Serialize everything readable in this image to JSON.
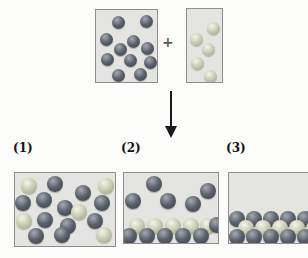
{
  "figure": {
    "plus_sign": "+",
    "options": [
      {
        "label": "(1)"
      },
      {
        "label": "(2)"
      },
      {
        "label": "(3)"
      }
    ],
    "colors": {
      "dark_sphere": "#5a6069",
      "light_sphere": "#c6cab0",
      "box_fill": "#e4e4e1",
      "box_border": "#8f8f8f",
      "arrow": "#1a1a1a"
    },
    "boxes": {
      "reactant_dark": {
        "x": 95,
        "y": 9,
        "w": 63,
        "h": 74,
        "r": 6.5,
        "spheres": [
          {
            "x": 22,
            "y": 12,
            "c": "d"
          },
          {
            "x": 50,
            "y": 11,
            "c": "d"
          },
          {
            "x": 10,
            "y": 29,
            "c": "d"
          },
          {
            "x": 37,
            "y": 31,
            "c": "d"
          },
          {
            "x": 24,
            "y": 39,
            "c": "d"
          },
          {
            "x": 51,
            "y": 38,
            "c": "d"
          },
          {
            "x": 11,
            "y": 49,
            "c": "d"
          },
          {
            "x": 34,
            "y": 50,
            "c": "d"
          },
          {
            "x": 54,
            "y": 52,
            "c": "d"
          },
          {
            "x": 22,
            "y": 65,
            "c": "d"
          },
          {
            "x": 44,
            "y": 64,
            "c": "d"
          }
        ]
      },
      "reactant_light": {
        "x": 186,
        "y": 8,
        "w": 37,
        "h": 75,
        "r": 6.5,
        "spheres": [
          {
            "x": 26,
            "y": 19,
            "c": "l"
          },
          {
            "x": 9,
            "y": 30,
            "c": "l"
          },
          {
            "x": 21,
            "y": 40,
            "c": "l"
          },
          {
            "x": 10,
            "y": 54,
            "c": "l"
          },
          {
            "x": 23,
            "y": 67,
            "c": "l"
          }
        ]
      },
      "result_1": {
        "x": 14,
        "y": 172,
        "w": 102,
        "h": 75,
        "r": 8,
        "spheres": [
          {
            "x": 14,
            "y": 13,
            "c": "l"
          },
          {
            "x": 40,
            "y": 11,
            "c": "d"
          },
          {
            "x": 68,
            "y": 20,
            "c": "d"
          },
          {
            "x": 91,
            "y": 13,
            "c": "l"
          },
          {
            "x": 29,
            "y": 27,
            "c": "d"
          },
          {
            "x": 8,
            "y": 30,
            "c": "d"
          },
          {
            "x": 87,
            "y": 30,
            "c": "d"
          },
          {
            "x": 50,
            "y": 35,
            "c": "d"
          },
          {
            "x": 64,
            "y": 39,
            "c": "l"
          },
          {
            "x": 9,
            "y": 48,
            "c": "l"
          },
          {
            "x": 30,
            "y": 47,
            "c": "d"
          },
          {
            "x": 80,
            "y": 48,
            "c": "d"
          },
          {
            "x": 53,
            "y": 53,
            "c": "d"
          },
          {
            "x": 21,
            "y": 63,
            "c": "d"
          },
          {
            "x": 47,
            "y": 62,
            "c": "d"
          },
          {
            "x": 89,
            "y": 62,
            "c": "l"
          }
        ]
      },
      "result_2": {
        "x": 123,
        "y": 172,
        "w": 96,
        "h": 72,
        "r": 8,
        "spheres": [
          {
            "x": 30,
            "y": 11,
            "c": "d"
          },
          {
            "x": 84,
            "y": 18,
            "c": "d"
          },
          {
            "x": 9,
            "y": 28,
            "c": "d"
          },
          {
            "x": 44,
            "y": 28,
            "c": "d"
          },
          {
            "x": 69,
            "y": 31,
            "c": "d"
          },
          {
            "x": 13,
            "y": 53,
            "c": "l"
          },
          {
            "x": 31,
            "y": 53,
            "c": "l"
          },
          {
            "x": 49,
            "y": 53,
            "c": "l"
          },
          {
            "x": 67,
            "y": 53,
            "c": "l"
          },
          {
            "x": 84,
            "y": 53,
            "c": "l"
          },
          {
            "x": 93,
            "y": 52,
            "c": "d"
          },
          {
            "x": 5,
            "y": 63,
            "c": "d"
          },
          {
            "x": 23,
            "y": 63,
            "c": "d"
          },
          {
            "x": 41,
            "y": 63,
            "c": "d"
          },
          {
            "x": 59,
            "y": 63,
            "c": "d"
          },
          {
            "x": 77,
            "y": 63,
            "c": "d"
          }
        ]
      },
      "result_3": {
        "x": 228,
        "y": 172,
        "w": 84,
        "h": 72,
        "r": 8,
        "spheres": [
          {
            "x": 8,
            "y": 46,
            "c": "d"
          },
          {
            "x": 25,
            "y": 46,
            "c": "d"
          },
          {
            "x": 42,
            "y": 46,
            "c": "d"
          },
          {
            "x": 59,
            "y": 46,
            "c": "d"
          },
          {
            "x": 76,
            "y": 46,
            "c": "d"
          },
          {
            "x": 17,
            "y": 55,
            "c": "l"
          },
          {
            "x": 34,
            "y": 55,
            "c": "l"
          },
          {
            "x": 51,
            "y": 55,
            "c": "l"
          },
          {
            "x": 68,
            "y": 55,
            "c": "l"
          },
          {
            "x": 85,
            "y": 55,
            "c": "l"
          },
          {
            "x": 8,
            "y": 64,
            "c": "d"
          },
          {
            "x": 25,
            "y": 64,
            "c": "d"
          },
          {
            "x": 42,
            "y": 64,
            "c": "d"
          },
          {
            "x": 59,
            "y": 64,
            "c": "d"
          },
          {
            "x": 76,
            "y": 64,
            "c": "d"
          }
        ]
      }
    }
  }
}
